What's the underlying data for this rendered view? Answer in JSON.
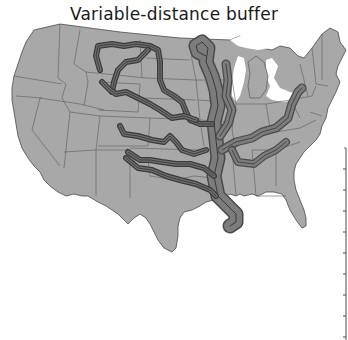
{
  "title": "Variable-distance buffer",
  "map": {
    "region": "Contiguous United States",
    "layers": [
      "state-boundaries",
      "river-buffers"
    ],
    "colors": {
      "land": "#a8a8a8",
      "state_border": "#5a5a5a",
      "buffer_fill": "#7c7c7c",
      "buffer_edge": "#4a4a4a",
      "river_line": "#3a3a3a",
      "water": "#ffffff"
    },
    "buffers": [
      {
        "name": "Mississippi River (upper)",
        "relative_width": "wide"
      },
      {
        "name": "Mississippi River (lower)",
        "relative_width": "widest"
      },
      {
        "name": "Missouri River",
        "relative_width": "narrow"
      },
      {
        "name": "Ohio River",
        "relative_width": "medium"
      },
      {
        "name": "Tennessee River",
        "relative_width": "medium"
      },
      {
        "name": "Illinois River",
        "relative_width": "medium"
      },
      {
        "name": "Platte River",
        "relative_width": "narrow"
      },
      {
        "name": "Yellowstone River",
        "relative_width": "narrow"
      },
      {
        "name": "Kansas River",
        "relative_width": "narrow"
      },
      {
        "name": "Arkansas River",
        "relative_width": "narrow"
      },
      {
        "name": "Canadian River",
        "relative_width": "narrow"
      },
      {
        "name": "Red River",
        "relative_width": "narrow"
      }
    ]
  },
  "scale_bar": {
    "ticks": 10
  }
}
